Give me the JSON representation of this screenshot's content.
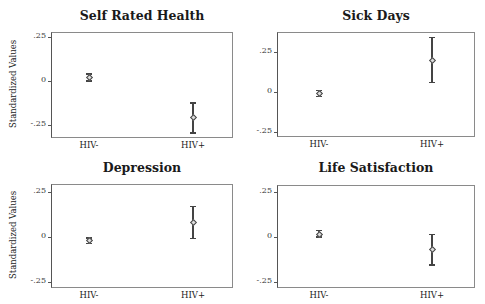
{
  "chart_data": [
    {
      "type": "scatter",
      "subtype": "point-with-confidence-interval",
      "title": "Self Rated Health",
      "xlabel": "",
      "ylabel": "Standardized Values",
      "categories": [
        "HIV-",
        "HIV+"
      ],
      "values": [
        0.02,
        -0.205
      ],
      "ci_low": [
        0.0,
        -0.295
      ],
      "ci_high": [
        0.04,
        -0.125
      ],
      "yticks": [
        ".25",
        "0",
        "-.25"
      ],
      "ylim": [
        -0.32,
        0.28
      ],
      "grid": false
    },
    {
      "type": "scatter",
      "subtype": "point-with-confidence-interval",
      "title": "Sick Days",
      "xlabel": "",
      "ylabel": "",
      "categories": [
        "HIV-",
        "HIV+"
      ],
      "values": [
        -0.01,
        0.2
      ],
      "ci_low": [
        -0.03,
        0.06
      ],
      "ci_high": [
        0.01,
        0.34
      ],
      "yticks": [
        ".25",
        "0",
        "-.25"
      ],
      "ylim": [
        -0.28,
        0.37
      ],
      "grid": false
    },
    {
      "type": "scatter",
      "subtype": "point-with-confidence-interval",
      "title": "Depression",
      "xlabel": "",
      "ylabel": "Standardized Values",
      "categories": [
        "HIV-",
        "HIV+"
      ],
      "values": [
        -0.02,
        0.08
      ],
      "ci_low": [
        -0.035,
        -0.01
      ],
      "ci_high": [
        -0.005,
        0.17
      ],
      "yticks": [
        ".25",
        "0",
        "-.25"
      ],
      "ylim": [
        -0.28,
        0.29
      ],
      "grid": false
    },
    {
      "type": "scatter",
      "subtype": "point-with-confidence-interval",
      "title": "Life Satisfaction",
      "xlabel": "",
      "ylabel": "",
      "categories": [
        "HIV-",
        "HIV+"
      ],
      "values": [
        0.015,
        -0.07
      ],
      "ci_low": [
        0.0,
        -0.155
      ],
      "ci_high": [
        0.035,
        0.015
      ],
      "yticks": [
        ".25",
        "0",
        "-.25"
      ],
      "ylim": [
        -0.28,
        0.29
      ],
      "grid": false
    }
  ],
  "layout": {
    "panels": [
      {
        "left": 51,
        "top": 32,
        "width": 182,
        "height": 106,
        "zero_y": 81,
        "px_per_unit": 176,
        "title_y": 8,
        "ylabel": true
      },
      {
        "left": 277,
        "top": 32,
        "width": 198,
        "height": 105,
        "zero_y": 92,
        "px_per_unit": 160,
        "title_y": 8,
        "ylabel": false
      },
      {
        "left": 51,
        "top": 184,
        "width": 182,
        "height": 104,
        "zero_y": 237,
        "px_per_unit": 180,
        "title_y": 160,
        "ylabel": true
      },
      {
        "left": 277,
        "top": 185,
        "width": 198,
        "height": 103,
        "zero_y": 237,
        "px_per_unit": 180,
        "title_y": 160,
        "ylabel": false
      }
    ],
    "x_positions": [
      [
        89,
        193
      ],
      [
        319,
        432
      ],
      [
        89,
        193
      ],
      [
        319,
        432
      ]
    ],
    "tick_values": [
      0.25,
      0,
      -0.25
    ],
    "colors": {
      "frame": "#8a8a8a",
      "axis": "#555555",
      "marker": "#444444"
    }
  }
}
